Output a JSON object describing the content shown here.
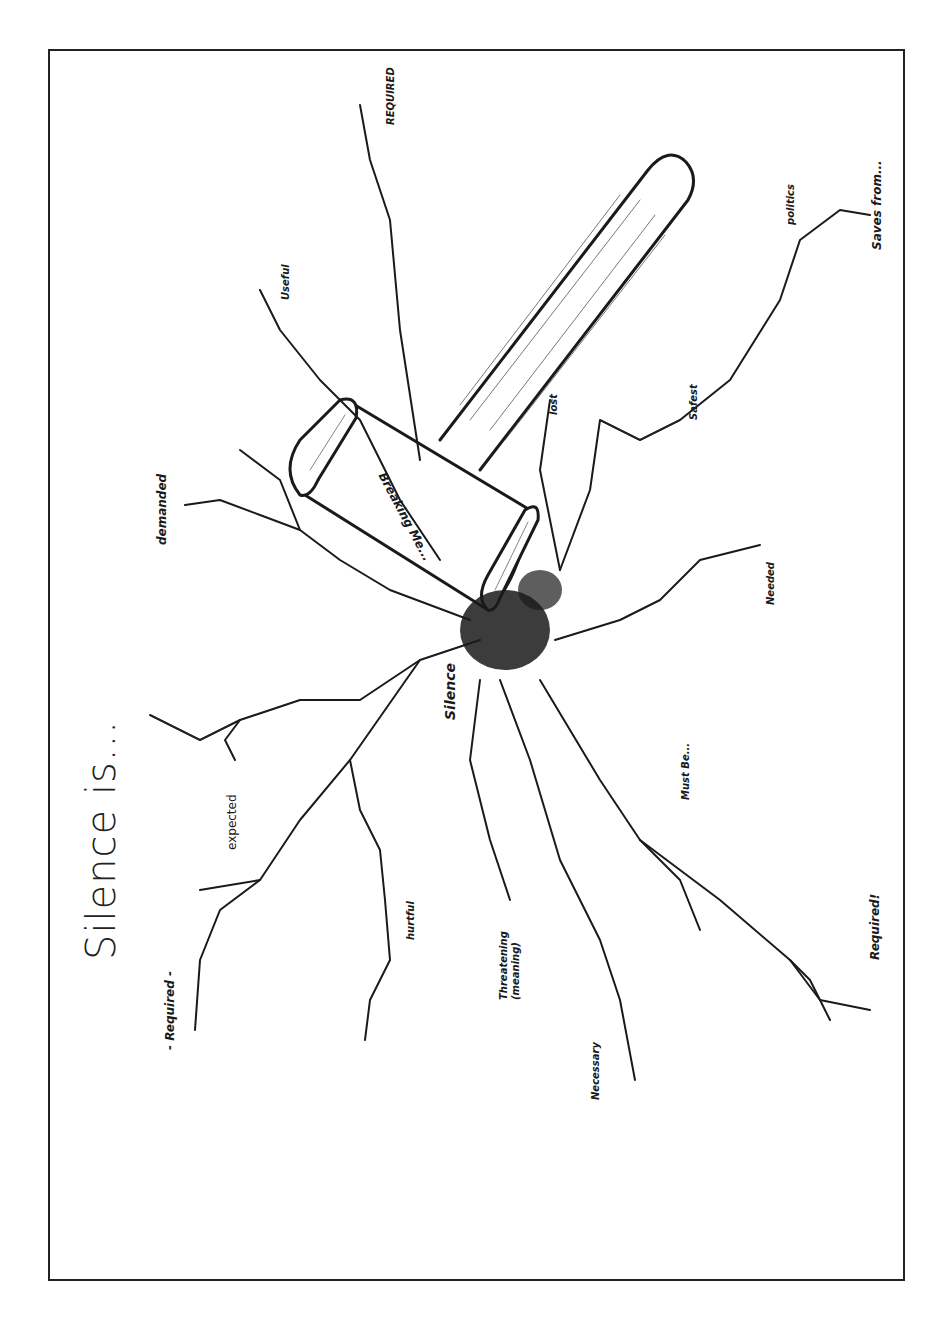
{
  "title": "Silence is...",
  "center_label": "Silence",
  "mallet_label": "Breaking Me...",
  "crack_labels": [
    {
      "id": "required-top-left",
      "text": "- Required -"
    },
    {
      "id": "expected",
      "text": "expected"
    },
    {
      "id": "demanded",
      "text": "demanded"
    },
    {
      "id": "useful",
      "text": "Useful"
    },
    {
      "id": "required-caps",
      "text": "REQUIRED"
    },
    {
      "id": "lost",
      "text": "lost"
    },
    {
      "id": "safest",
      "text": "Safest"
    },
    {
      "id": "politics",
      "text": "politics"
    },
    {
      "id": "saves-from",
      "text": "Saves from..."
    },
    {
      "id": "needed",
      "text": "Needed"
    },
    {
      "id": "must-be",
      "text": "Must Be..."
    },
    {
      "id": "required-exclaim",
      "text": "Required!"
    },
    {
      "id": "hurtful",
      "text": "hurtful"
    },
    {
      "id": "threatening",
      "text": "Threatening (meaning)"
    },
    {
      "id": "necessary",
      "text": "Necessary"
    }
  ],
  "colors": {
    "ink": "#1a1a1a",
    "paper": "#ffffff",
    "border": "#222222"
  }
}
